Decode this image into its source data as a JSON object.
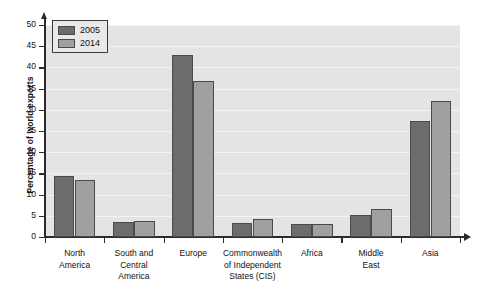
{
  "chart_data": {
    "type": "bar",
    "title": "",
    "subtitle": "",
    "xlabel": "",
    "ylabel": "Percentage of world exports",
    "ylim": [
      0,
      50
    ],
    "ytick_step": 5,
    "yticks": [
      "0",
      "5",
      "10",
      "15",
      "20",
      "25",
      "30",
      "35",
      "40",
      "45",
      "50"
    ],
    "grid": true,
    "grid_axis": "y",
    "legend_position": "top-left",
    "categories": [
      "North\nAmerica",
      "South and\nCentral\nAmerica",
      "Europe",
      "Commonwealth\nof Independent\nStates (CIS)",
      "Africa",
      "Middle\nEast",
      "Asia"
    ],
    "series": [
      {
        "name": "2005",
        "color": "#6c6c6c",
        "values": [
          14.4,
          3.5,
          43.0,
          3.4,
          3.0,
          5.3,
          27.4
        ]
      },
      {
        "name": "2014",
        "color": "#a0a0a0",
        "values": [
          13.4,
          3.8,
          36.8,
          4.3,
          3.0,
          6.7,
          32.0
        ]
      }
    ],
    "colors": {
      "plot_background": "#e4e4e4",
      "gridline": "#f4f4f4",
      "axis": "#2b2b2b",
      "bar_edge": "#4a4a4a",
      "page_background": "#ffffff"
    }
  },
  "legend": {
    "items": [
      {
        "label": "2005"
      },
      {
        "label": "2014"
      }
    ]
  }
}
